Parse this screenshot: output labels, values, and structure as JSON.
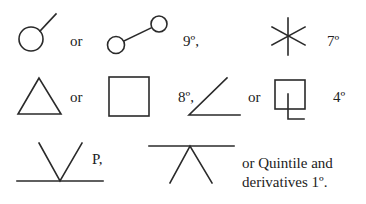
{
  "diagram": {
    "rows": [
      {
        "symbols": [
          {
            "name": "conjunction-circle-with-line-icon"
          },
          {
            "name": "opposition-two-circles-icon"
          },
          {
            "name": "asterisk-six-point-icon"
          }
        ],
        "labels": {
          "or1": "or",
          "orb1": "9º,",
          "orb2": "7º"
        }
      },
      {
        "symbols": [
          {
            "name": "triangle-icon"
          },
          {
            "name": "square-icon"
          },
          {
            "name": "angle-icon"
          },
          {
            "name": "square-with-hook-icon"
          }
        ],
        "labels": {
          "or1": "or",
          "orb1": "8º,",
          "or2": "or",
          "orb2": "4º"
        }
      },
      {
        "symbols": [
          {
            "name": "v-on-line-icon"
          },
          {
            "name": "inverted-v-under-line-icon"
          }
        ],
        "labels": {
          "p": "P,",
          "line1": "or Quintile and",
          "line2": "derivatives 1º."
        }
      }
    ],
    "color": "#2a2a2a"
  }
}
